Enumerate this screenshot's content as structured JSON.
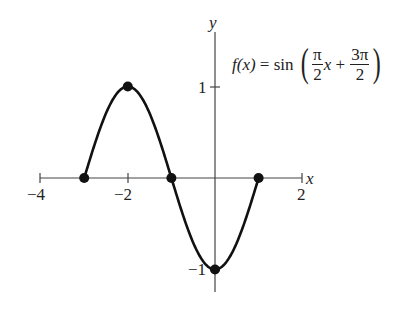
{
  "chart_data": {
    "type": "line",
    "function": "sin((pi/2)*x + 3*pi/2)",
    "xlabel": "x",
    "ylabel": "y",
    "xlim": [
      -4,
      2
    ],
    "ylim": [
      -1,
      1
    ],
    "x_ticks": [
      -4,
      -3,
      -2,
      -1,
      0,
      1,
      2
    ],
    "x_tick_labels": [
      "−4",
      "−2",
      "2"
    ],
    "y_ticks": [
      1,
      -1
    ],
    "y_tick_labels": [
      "1",
      "−1"
    ],
    "domain": [
      -3,
      1
    ],
    "points": [
      {
        "x": -3,
        "y": 0
      },
      {
        "x": -2,
        "y": 1
      },
      {
        "x": -1,
        "y": 0
      },
      {
        "x": 0,
        "y": -1
      },
      {
        "x": 1,
        "y": 0
      }
    ],
    "grid": false,
    "legend": "none"
  },
  "labels": {
    "x_axis": "x",
    "y_axis": "y",
    "tick_neg4": "−4",
    "tick_neg2": "−2",
    "tick_2": "2",
    "tick_y1": "1",
    "tick_yneg1": "−1"
  },
  "equation": {
    "lhs": "f(x)",
    "eq": " = sin ",
    "frac1_num": "π",
    "frac1_den": "2",
    "var": "x",
    "plus": " + ",
    "frac2_num": "3π",
    "frac2_den": "2"
  }
}
